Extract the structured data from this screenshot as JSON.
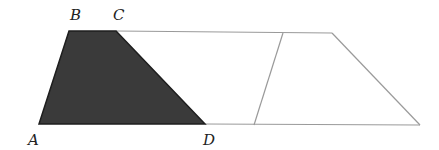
{
  "diagram": {
    "colors": {
      "shaded_fill": "#3a3a3a",
      "shaded_edge": "#1e1e1e",
      "line": "#9a9a9a",
      "label": "#222222"
    },
    "labels": {
      "A": "A",
      "B": "B",
      "C": "C",
      "D": "D"
    },
    "points": {
      "A": [
        39,
        124
      ],
      "B": [
        69,
        31
      ],
      "C": [
        116,
        31
      ],
      "D": [
        205,
        124
      ],
      "E": [
        283,
        33
      ],
      "F": [
        254,
        125
      ],
      "G": [
        332,
        33
      ],
      "H": [
        420,
        125
      ]
    },
    "shapes": [
      {
        "name": "shaded-trapezoid-ABCD",
        "vertices": [
          "A",
          "B",
          "C",
          "D"
        ],
        "shaded": true
      },
      {
        "name": "middle-parallelogram",
        "vertices": [
          "C",
          "E",
          "F",
          "D"
        ],
        "shaded": false
      },
      {
        "name": "right-trapezoid",
        "vertices": [
          "F",
          "E",
          "G",
          "H"
        ],
        "shaded": false
      }
    ]
  }
}
